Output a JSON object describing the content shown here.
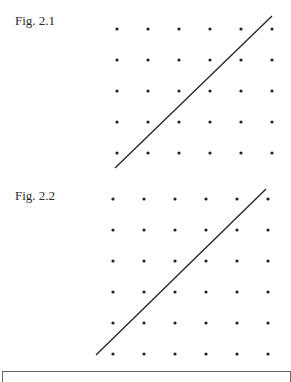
{
  "figures": [
    {
      "label": "Fig. 2.1",
      "label_pos": [
        15,
        13
      ],
      "grid": {
        "cols": 6,
        "rows": 5,
        "x0": 117,
        "y0": 29,
        "dx": 31,
        "dy": 31,
        "dot_radius": 1.6
      },
      "line": {
        "x1": 115,
        "y1": 168,
        "x2": 272,
        "y2": 16
      }
    },
    {
      "label": "Fig. 2.2",
      "label_pos": [
        15,
        188
      ],
      "grid": {
        "cols": 6,
        "rows": 6,
        "x0": 113,
        "y0": 199,
        "dx": 31,
        "dy": 31,
        "dot_radius": 1.6
      },
      "line": {
        "x1": 96,
        "y1": 355,
        "x2": 266,
        "y2": 189
      }
    }
  ],
  "colors": {
    "dot": "#222222",
    "line": "#222222",
    "frame": "#666666"
  }
}
